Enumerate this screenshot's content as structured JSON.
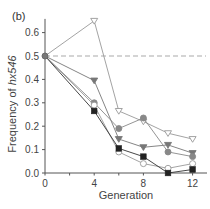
{
  "chart_data": {
    "type": "line",
    "panel_label": "(b)",
    "title": "",
    "xlabel": "Generation",
    "ylabel_prefix": "Frequency of ",
    "ylabel_italic": "hx546",
    "xlim": [
      0,
      13
    ],
    "ylim": [
      0.0,
      0.65
    ],
    "x_ticks": [
      0,
      2,
      4,
      6,
      8,
      10,
      12
    ],
    "x_tick_labels": [
      "0",
      "4",
      "8",
      "12"
    ],
    "x_tick_label_values": [
      0,
      4,
      8,
      12
    ],
    "y_ticks": [
      0.0,
      0.1,
      0.2,
      0.3,
      0.4,
      0.5,
      0.6
    ],
    "y_tick_labels": [
      "0.0",
      "0.1",
      "0.2",
      "0.3",
      "0.4",
      "0.5",
      "0.6"
    ],
    "grid": false,
    "legend": "none",
    "reference_line": {
      "y": 0.5,
      "style": "dashed",
      "color": "#aaaaaa"
    },
    "x": [
      0,
      4,
      6,
      8,
      10,
      12
    ],
    "series": [
      {
        "name": "open-triangle",
        "marker": "triangle-down-open",
        "color": "#999999",
        "values": [
          0.5,
          0.65,
          0.265,
          0.22,
          0.17,
          0.145
        ]
      },
      {
        "name": "filled-triangle",
        "marker": "triangle-down-filled",
        "color": "#777777",
        "values": [
          0.5,
          0.395,
          0.145,
          0.11,
          0.12,
          0.085
        ]
      },
      {
        "name": "gray-circle",
        "marker": "circle-filled",
        "color": "#888888",
        "values": [
          0.5,
          0.3,
          0.19,
          0.235,
          0.09,
          0.07
        ]
      },
      {
        "name": "open-circle",
        "marker": "circle-open",
        "color": "#999999",
        "values": [
          0.5,
          0.29,
          0.09,
          0.04,
          0.02,
          0.04
        ]
      },
      {
        "name": "filled-square",
        "marker": "square-filled",
        "color": "#333333",
        "values": [
          0.5,
          0.265,
          0.105,
          0.07,
          0.0,
          0.015
        ]
      }
    ]
  }
}
